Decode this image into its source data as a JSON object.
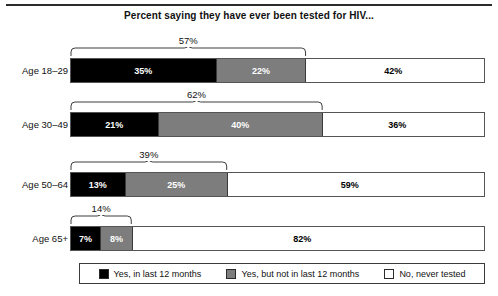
{
  "figure": {
    "title": "Percent saying they have ever been tested for HIV...",
    "top_rule": true
  },
  "legend": {
    "position": "bottom",
    "items": [
      {
        "label": "Yes, in last 12 months",
        "swatch": "black-swatch-icon",
        "color": "#000000"
      },
      {
        "label": "Yes, but not in last 12 months",
        "swatch": "gray-swatch-icon",
        "color": "#7d7d7d"
      },
      {
        "label": "No, never tested",
        "swatch": "white-swatch-icon",
        "color": "#ffffff"
      }
    ]
  },
  "rows": [
    {
      "category": "Age 18–29",
      "total_label": "57%",
      "segments": [
        {
          "label": "35%",
          "value": 35
        },
        {
          "label": "22%",
          "value": 22
        },
        {
          "label": "42%",
          "value": 42
        }
      ]
    },
    {
      "category": "Age 30–49",
      "total_label": "62%",
      "segments": [
        {
          "label": "21%",
          "value": 21
        },
        {
          "label": "40%",
          "value": 40
        },
        {
          "label": "36%",
          "value": 36
        }
      ]
    },
    {
      "category": "Age 50–64",
      "total_label": "39%",
      "segments": [
        {
          "label": "13%",
          "value": 13
        },
        {
          "label": "25%",
          "value": 25
        },
        {
          "label": "59%",
          "value": 59
        }
      ]
    },
    {
      "category": "Age 65+",
      "total_label": "14%",
      "segments": [
        {
          "label": "7%",
          "value": 7
        },
        {
          "label": "8%",
          "value": 8
        },
        {
          "label": "82%",
          "value": 82
        }
      ]
    }
  ],
  "chart_data": {
    "type": "bar",
    "orientation": "horizontal",
    "stacked": true,
    "title": "Percent saying they have ever been tested for HIV...",
    "xlabel": "",
    "ylabel": "",
    "xlim": [
      0,
      100
    ],
    "grid": false,
    "legend_position": "bottom",
    "units": "percent",
    "categories": [
      "Age 18–29",
      "Age 30–49",
      "Age 50–64",
      "Age 65+"
    ],
    "series": [
      {
        "name": "Yes, in last 12 months",
        "color": "#000000",
        "values": [
          35,
          21,
          13,
          7
        ]
      },
      {
        "name": "Yes, but not in last 12 months",
        "color": "#7d7d7d",
        "values": [
          22,
          40,
          25,
          8
        ]
      },
      {
        "name": "No, never tested",
        "color": "#ffffff",
        "values": [
          42,
          36,
          59,
          82
        ]
      }
    ],
    "annotations": [
      {
        "category": "Age 18–29",
        "text": "57%",
        "spans": [
          "Yes, in last 12 months",
          "Yes, but not in last 12 months"
        ]
      },
      {
        "category": "Age 30–49",
        "text": "62%",
        "spans": [
          "Yes, in last 12 months",
          "Yes, but not in last 12 months"
        ]
      },
      {
        "category": "Age 50–64",
        "text": "39%",
        "spans": [
          "Yes, in last 12 months",
          "Yes, but not in last 12 months"
        ]
      },
      {
        "category": "Age 65+",
        "text": "14%",
        "spans": [
          "Yes, in last 12 months",
          "Yes, but not in last 12 months"
        ]
      }
    ]
  }
}
